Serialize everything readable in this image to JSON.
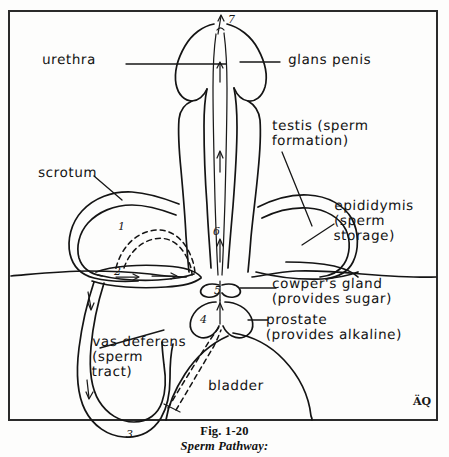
{
  "figure": {
    "caption_number": "Fig. 1-20",
    "caption_title": "Sperm Pathway:",
    "signature": "ÄQ",
    "frame_color": "#2a2a2a",
    "ink_color": "#141414",
    "background_color": "#fdfdfc"
  },
  "labels": {
    "urethra": "urethra",
    "glans_penis": "glans penis",
    "testis": "testis (sperm\nformation)",
    "scrotum": "scrotum",
    "epididymis": "epididymis\n(sperm\nstorage)",
    "cowpers_gland": "cowper's gland\n(provides sugar)",
    "prostate": "prostate\n(provides alkaline)",
    "vas_deferens": "vas deferens\n(sperm\ntract)",
    "bladder": "bladder"
  },
  "pathway_markers": {
    "m1": "1",
    "m2": "2",
    "m3": "3",
    "m4": "4",
    "m5": "5",
    "m6": "6",
    "m7": "7"
  }
}
